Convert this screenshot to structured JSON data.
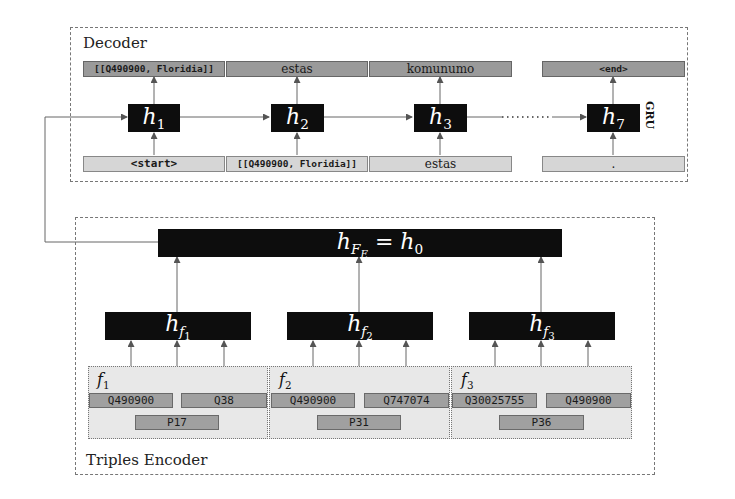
{
  "decoder": {
    "title": "Decoder",
    "cell_label": "GRU",
    "outputs": [
      "[[Q490900, Floridia]]",
      "estas",
      "komunumo",
      "<end>"
    ],
    "inputs": [
      "<start>",
      "[[Q490900, Floridia]]",
      "estas",
      "."
    ],
    "hidden_states": [
      {
        "base": "h",
        "sub": "1"
      },
      {
        "base": "h",
        "sub": "2"
      },
      {
        "base": "h",
        "sub": "3"
      },
      {
        "base": "h",
        "sub": "7"
      }
    ],
    "ellipsis": "·······"
  },
  "encoder": {
    "title": "Triples Encoder",
    "aggregate": {
      "base": "h",
      "sub": "F",
      "subsub": "E",
      "eq": " = ",
      "rhs_base": "h",
      "rhs_sub": "0"
    },
    "fact_states": [
      {
        "base": "h",
        "sub": "f",
        "subsub": "1"
      },
      {
        "base": "h",
        "sub": "f",
        "subsub": "2"
      },
      {
        "base": "h",
        "sub": "f",
        "subsub": "3"
      }
    ],
    "triples": [
      {
        "label": "f",
        "index": "1",
        "subject": "Q490900",
        "object": "Q38",
        "predicate": "P17"
      },
      {
        "label": "f",
        "index": "2",
        "subject": "Q490900",
        "object": "Q747074",
        "predicate": "P31"
      },
      {
        "label": "f",
        "index": "3",
        "subject": "Q30025755",
        "object": "Q490900",
        "predicate": "P36"
      }
    ]
  },
  "colors": {
    "hidden_box": "#0d0d0d",
    "output_token": "#9a9a9a",
    "input_token": "#d6d6d6",
    "triple_bg": "#e8e8e8",
    "entity_box": "#a0a0a0"
  }
}
